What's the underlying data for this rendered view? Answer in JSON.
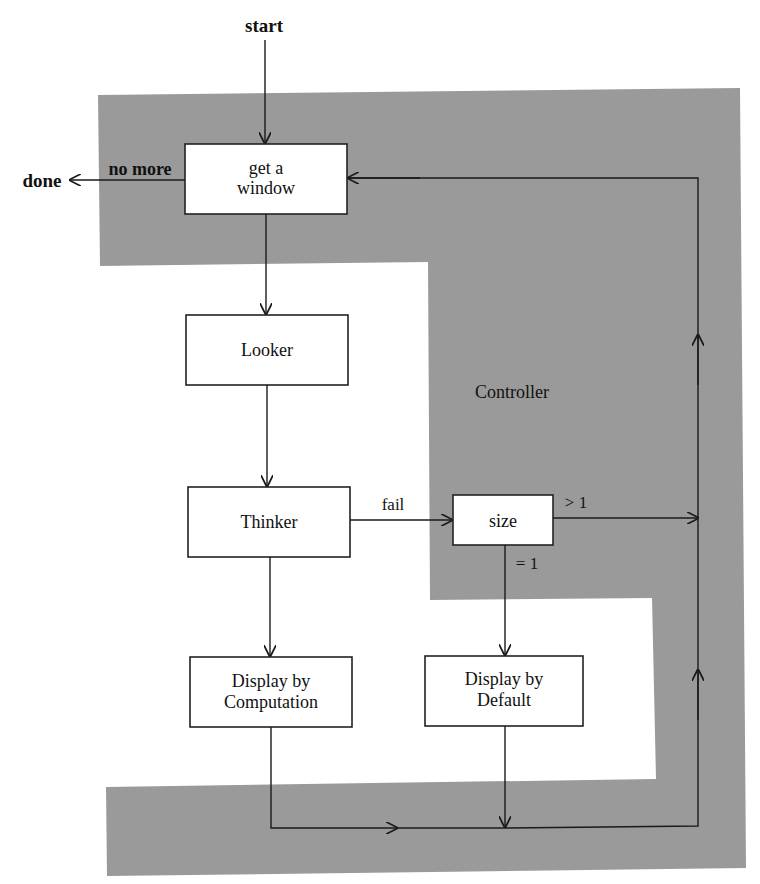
{
  "diagram": {
    "colors": {
      "shade": "#9a9a9a",
      "box_fill": "#ffffff",
      "line": "#1a1a1a"
    },
    "region_label": "Controller",
    "terminals": {
      "start": "start",
      "done": "done"
    },
    "nodes": {
      "get_window": {
        "line1": "get a",
        "line2": "window"
      },
      "looker": {
        "label": "Looker"
      },
      "thinker": {
        "label": "Thinker"
      },
      "size": {
        "label": "size"
      },
      "display_computation": {
        "line1": "Display by",
        "line2": "Computation"
      },
      "display_default": {
        "line1": "Display by",
        "line2": "Default"
      }
    },
    "edge_labels": {
      "no_more": "no more",
      "fail": "fail",
      "gt1": "> 1",
      "eq1": "= 1"
    }
  }
}
